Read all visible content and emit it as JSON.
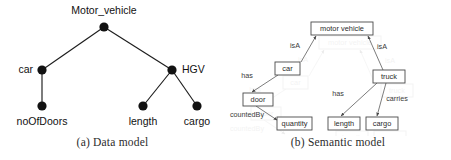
{
  "figure": {
    "panels": [
      {
        "id": "data-model",
        "caption": "(a) Data model",
        "type": "tree",
        "nodes": [
          {
            "id": "motor_vehicle",
            "label": "Motor_vehicle",
            "x": 104,
            "y": 27,
            "label_x": 104,
            "label_y": 14,
            "anchor": "middle"
          },
          {
            "id": "car",
            "label": "car",
            "x": 42,
            "y": 70,
            "label_x": 33,
            "label_y": 73,
            "anchor": "end"
          },
          {
            "id": "hgv",
            "label": "HGV",
            "x": 172,
            "y": 70,
            "label_x": 182,
            "label_y": 73,
            "anchor": "start"
          },
          {
            "id": "noofdoors",
            "label": "noOfDoors",
            "x": 42,
            "y": 106,
            "label_x": 42,
            "label_y": 125,
            "anchor": "middle"
          },
          {
            "id": "length",
            "label": "length",
            "x": 143,
            "y": 106,
            "label_x": 143,
            "label_y": 125,
            "anchor": "middle"
          },
          {
            "id": "cargo",
            "label": "cargo",
            "x": 197,
            "y": 106,
            "label_x": 197,
            "label_y": 125,
            "anchor": "middle"
          }
        ],
        "edges": [
          {
            "from": "motor_vehicle",
            "to": "car"
          },
          {
            "from": "motor_vehicle",
            "to": "hgv"
          },
          {
            "from": "car",
            "to": "noofdoors"
          },
          {
            "from": "hgv",
            "to": "length"
          },
          {
            "from": "hgv",
            "to": "cargo"
          }
        ]
      },
      {
        "id": "semantic-model",
        "caption": "(b) Semantic model",
        "type": "graph",
        "boxes": [
          {
            "id": "motor_vehicle",
            "label": "motor vehicle",
            "x": 86,
            "y": 22,
            "w": 62,
            "h": 13
          },
          {
            "id": "car",
            "label": "car",
            "x": 50,
            "y": 62,
            "w": 25,
            "h": 13
          },
          {
            "id": "truck",
            "label": "truck",
            "x": 148,
            "y": 70,
            "w": 32,
            "h": 13
          },
          {
            "id": "door",
            "label": "door",
            "x": 18,
            "y": 93,
            "w": 30,
            "h": 13
          },
          {
            "id": "quantity",
            "label": "quantity",
            "x": 52,
            "y": 117,
            "w": 35,
            "h": 13
          },
          {
            "id": "length",
            "label": "length",
            "x": 103,
            "y": 117,
            "w": 32,
            "h": 13
          },
          {
            "id": "cargo",
            "label": "cargo",
            "x": 141,
            "y": 117,
            "w": 32,
            "h": 13
          }
        ],
        "relations": [
          {
            "label": "isA",
            "from": "car",
            "to": "motor_vehicle",
            "x1": 76,
            "y1": 62,
            "x2": 91,
            "y2": 36,
            "label_x": 70,
            "label_y": 48
          },
          {
            "label": "isA",
            "from": "truck",
            "to": "motor_vehicle",
            "x1": 158,
            "y1": 70,
            "x2": 143,
            "y2": 36,
            "label_x": 157,
            "label_y": 49
          },
          {
            "label": "has",
            "from": "car",
            "to": "door",
            "x1": 53,
            "y1": 75,
            "x2": 27,
            "y2": 92,
            "label_x": 22,
            "label_y": 78
          },
          {
            "label": "countedBy",
            "from": "door",
            "to": "quantity",
            "x1": 31,
            "y1": 106,
            "x2": 52,
            "y2": 120,
            "label_x": 2,
            "label_y": 117
          },
          {
            "label": "has",
            "from": "truck",
            "to": "length",
            "x1": 152,
            "y1": 83,
            "x2": 116,
            "y2": 116,
            "label_x": 113,
            "label_y": 96
          },
          {
            "label": "carries",
            "from": "truck",
            "to": "cargo",
            "x1": 161,
            "y1": 83,
            "x2": 152,
            "y2": 116,
            "label_x": 168,
            "label_y": 101
          }
        ]
      }
    ]
  }
}
